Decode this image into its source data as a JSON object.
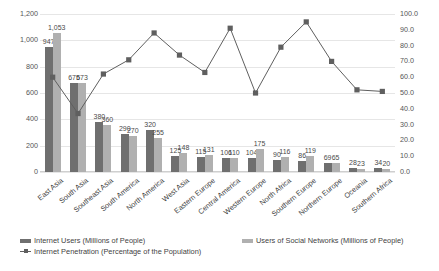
{
  "chart_data": {
    "type": "bar",
    "title": "",
    "subtitle": "",
    "xlabel": "",
    "ylabel": "",
    "y2label": "",
    "grid": true,
    "legend_position": "bottom",
    "ylim": [
      0,
      1200
    ],
    "y2lim": [
      0,
      100
    ],
    "yticks": [
      "0",
      "200",
      "400",
      "600",
      "800",
      "1,000",
      "1,200"
    ],
    "ytick_values": [
      0,
      200,
      400,
      600,
      800,
      1000,
      1200
    ],
    "y2ticks": [
      "0.0",
      "10.0",
      "20.0",
      "30.0",
      "40.0",
      "50.0",
      "60.0",
      "70.0",
      "80.0",
      "90.0",
      "100.0"
    ],
    "y2tick_values": [
      0,
      10,
      20,
      30,
      40,
      50,
      60,
      70,
      80,
      90,
      100
    ],
    "categories": [
      "East Asia",
      "South Asia",
      "Southeast Asia",
      "South America",
      "North America",
      "West Asia",
      "Eastern Europe",
      "Central America",
      "Western Europe",
      "North Africa",
      "Southern Europe",
      "Northern Europe",
      "Oceania",
      "Southern Africa"
    ],
    "series": [
      {
        "name": "Internet Users (Millions of People)",
        "type": "bar",
        "axis": "left",
        "color": "#6f6f6f",
        "values": [
          947,
          675,
          380,
          290,
          320,
          125,
          115,
          106,
          104,
          90,
          86,
          69,
          28,
          34
        ]
      },
      {
        "name": "Users of Social Networks (Millions of People)",
        "type": "bar",
        "axis": "left",
        "color": "#b0b0b0",
        "values": [
          1053,
          673,
          360,
          270,
          255,
          148,
          131,
          110,
          175,
          116,
          119,
          65,
          23,
          20
        ]
      },
      {
        "name": "Internet Penetration (Percentage of the Population)",
        "type": "line",
        "axis": "right",
        "color": "#5f5f5f",
        "values": [
          60.0,
          37.0,
          62.0,
          71.0,
          88.0,
          74.0,
          63.0,
          91.0,
          50.0,
          79.0,
          95.0,
          70.0,
          52.0,
          51.0
        ]
      }
    ]
  },
  "legend": {
    "items": [
      {
        "label": "Internet Users (Millions of People)",
        "marker": "bar-swatch-dark"
      },
      {
        "label": "Users of Social Networks (Millions of People)",
        "marker": "bar-swatch-light"
      },
      {
        "label": "Internet Penetration (Percentage of the Population)",
        "marker": "line-marker"
      }
    ]
  }
}
